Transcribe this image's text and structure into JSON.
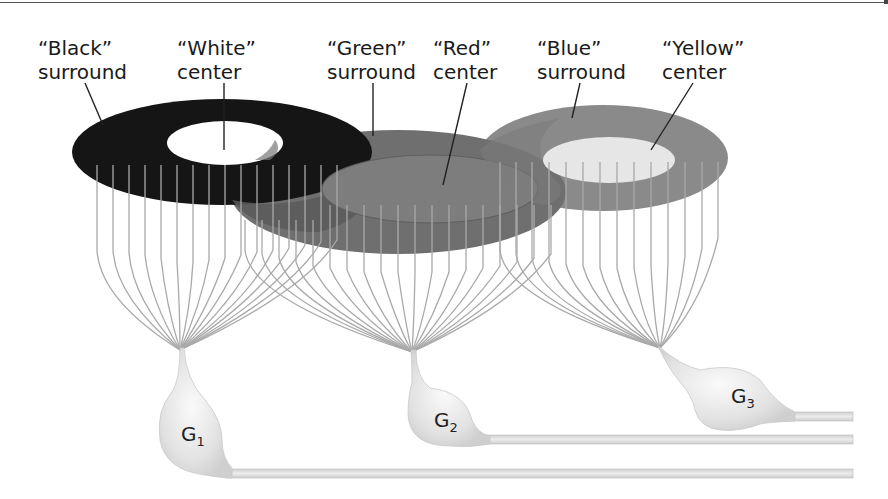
{
  "diagram": {
    "type": "receptive-field-illustration",
    "labels": [
      {
        "id": "black-surround",
        "line1": "“Black”",
        "line2": "surround"
      },
      {
        "id": "white-center",
        "line1": "“White”",
        "line2": "center"
      },
      {
        "id": "green-surround",
        "line1": "“Green”",
        "line2": "surround"
      },
      {
        "id": "red-center",
        "line1": "“Red”",
        "line2": "center"
      },
      {
        "id": "blue-surround",
        "line1": "“Blue”",
        "line2": "surround"
      },
      {
        "id": "yellow-center",
        "line1": "“Yellow”",
        "line2": "center"
      }
    ],
    "cells": [
      {
        "id": "G1",
        "letter": "G",
        "sub": "1"
      },
      {
        "id": "G2",
        "letter": "G",
        "sub": "2"
      },
      {
        "id": "G3",
        "letter": "G",
        "sub": "3"
      }
    ],
    "colors": {
      "black_surround": "#141414",
      "white_center": "#ffffff",
      "green_surround": "#6e6e6e",
      "red_center": "#7a7a7a",
      "blue_surround": "#8a8a8a",
      "yellow_center": "#e6e6e6",
      "fibers": "#a8a8a8",
      "cell_body": "#e4e4e4",
      "leader_lines": "#222222"
    }
  }
}
